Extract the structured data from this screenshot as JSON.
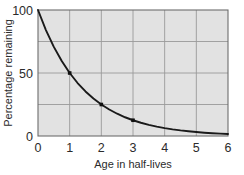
{
  "chart_data": {
    "type": "line",
    "title": "",
    "xlabel": "Age in half-lives",
    "ylabel": "Percentage remaining",
    "xlim": [
      0,
      6
    ],
    "ylim": [
      0,
      100
    ],
    "xticks": [
      0,
      1,
      2,
      3,
      4,
      5,
      6
    ],
    "xtick_labels": [
      "0",
      "1",
      "2",
      "3",
      "4",
      "5",
      "6"
    ],
    "yticks": [
      0,
      50,
      100
    ],
    "ytick_labels": [
      "0",
      "50",
      "100"
    ],
    "grid": true,
    "grid_x_values": [
      1,
      2,
      3,
      4,
      5
    ],
    "grid_y_values": [
      25,
      50,
      75
    ],
    "legend": "none",
    "plot_background": "#e2e2e2",
    "grid_color": "#9a9a9a",
    "line_color": "#1a1a1a",
    "marker_color": "#111111",
    "series": [
      {
        "name": "Percentage remaining",
        "x": [
          0,
          0.25,
          0.5,
          0.75,
          1,
          1.25,
          1.5,
          1.75,
          2,
          2.25,
          2.5,
          2.75,
          3,
          3.25,
          3.5,
          3.75,
          4,
          4.25,
          4.5,
          4.75,
          5,
          5.25,
          5.5,
          5.75,
          6
        ],
        "values": [
          100,
          84.09,
          70.71,
          59.46,
          50,
          42.04,
          35.36,
          29.73,
          25,
          21.02,
          17.68,
          14.87,
          12.5,
          10.51,
          8.84,
          7.43,
          6.25,
          5.26,
          4.42,
          3.72,
          3.125,
          2.63,
          2.21,
          1.86,
          1.5625
        ]
      }
    ],
    "markers": [
      {
        "x": 1,
        "y": 50,
        "label": "50"
      },
      {
        "x": 2,
        "y": 25,
        "label": "25"
      },
      {
        "x": 3,
        "y": 12.5,
        "label": "12.5"
      }
    ],
    "annotations": []
  }
}
